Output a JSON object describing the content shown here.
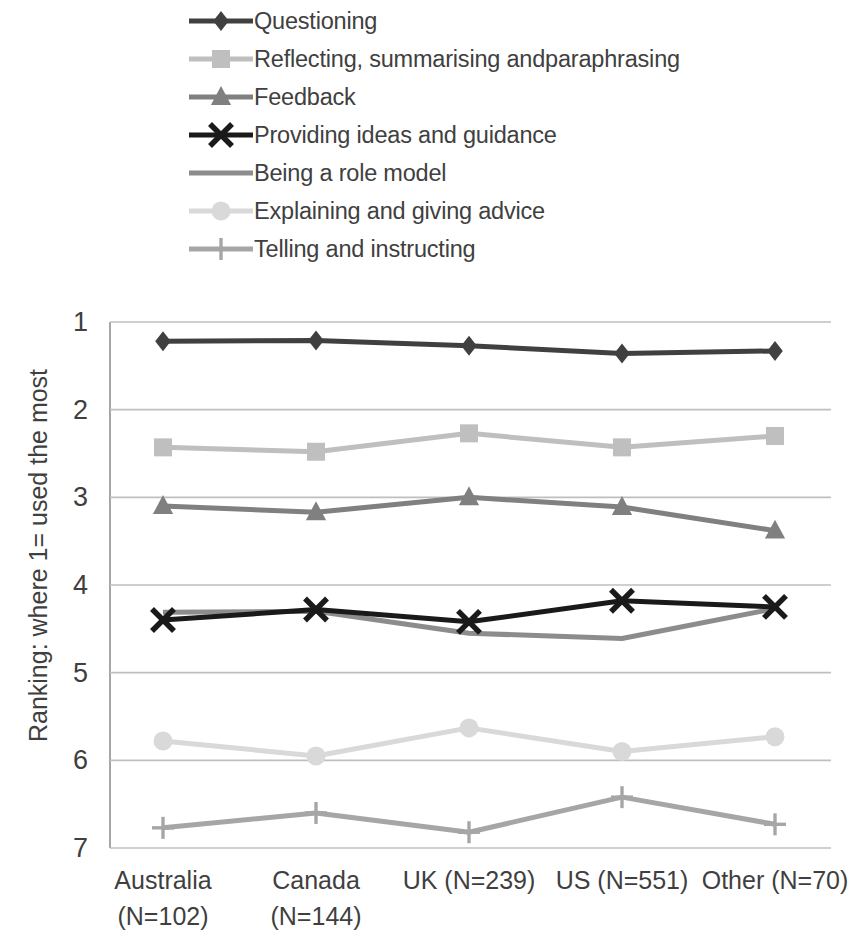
{
  "chart_data": {
    "type": "line",
    "title": "",
    "xlabel": "",
    "ylabel": "Ranking: where 1= used the most",
    "ylim": [
      1,
      7
    ],
    "y_inverted": true,
    "yticks": [
      1,
      2,
      3,
      4,
      5,
      6,
      7
    ],
    "grid": "horizontal",
    "legend_position": "top",
    "categories": [
      "Australia (N=102)",
      "Canada (N=144)",
      "UK (N=239)",
      "US (N=551)",
      "Other (N=70)"
    ],
    "category_lines": [
      [
        "Australia",
        "(N=102)"
      ],
      [
        "Canada",
        "(N=144)"
      ],
      [
        "UK (N=239)",
        ""
      ],
      [
        "US (N=551)",
        ""
      ],
      [
        "Other (N=70)",
        ""
      ]
    ],
    "series": [
      {
        "name": "Questioning",
        "marker": "diamond",
        "color": "#404040",
        "line_width": 5,
        "values": [
          1.22,
          1.21,
          1.27,
          1.36,
          1.33
        ]
      },
      {
        "name": "Reflecting, summarising and paraphrasing",
        "marker": "square",
        "color": "#bfbfbf",
        "line_width": 5,
        "values": [
          2.43,
          2.48,
          2.27,
          2.43,
          2.3
        ]
      },
      {
        "name": "Feedback",
        "marker": "triangle",
        "color": "#808080",
        "line_width": 5,
        "values": [
          3.1,
          3.17,
          3.0,
          3.11,
          3.38
        ]
      },
      {
        "name": "Providing ideas and guidance",
        "marker": "cross",
        "color": "#1a1a1a",
        "line_width": 5,
        "values": [
          4.4,
          4.28,
          4.42,
          4.18,
          4.25
        ]
      },
      {
        "name": "Being a role model",
        "marker": "none",
        "color": "#8c8c8c",
        "line_width": 5,
        "values": [
          4.31,
          4.3,
          4.55,
          4.61,
          4.27
        ]
      },
      {
        "name": "Explaining and giving advice",
        "marker": "circle",
        "color": "#d9d9d9",
        "line_width": 5,
        "values": [
          5.78,
          5.95,
          5.63,
          5.9,
          5.73
        ]
      },
      {
        "name": "Telling and instructing",
        "marker": "plus",
        "color": "#a6a6a6",
        "line_width": 5,
        "values": [
          6.77,
          6.6,
          6.82,
          6.42,
          6.73
        ]
      }
    ]
  },
  "legend": {
    "items": [
      {
        "label": "Questioning"
      },
      {
        "label": "Reflecting, summarising andparaphrasing"
      },
      {
        "label": "Feedback"
      },
      {
        "label": "Providing ideas and guidance"
      },
      {
        "label": "Being a role model"
      },
      {
        "label": "Explaining and giving advice"
      },
      {
        "label": "Telling and instructing"
      }
    ]
  },
  "axes": {
    "y_title": "Ranking: where 1= used the most",
    "y_tick_labels": [
      "1",
      "2",
      "3",
      "4",
      "5",
      "6",
      "7"
    ]
  },
  "colors": {
    "grid": "#bfbfbf",
    "axis": "#a6a6a6",
    "text": "#3f3f3f"
  }
}
